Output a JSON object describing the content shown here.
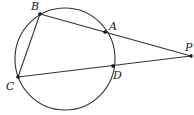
{
  "diagram": {
    "type": "geometry",
    "circle": {
      "cx": 65,
      "cy": 59,
      "rx": 50,
      "ry": 51
    },
    "points": [
      {
        "id": "B",
        "label": "B",
        "x": 40,
        "y": 14,
        "lx": 31,
        "ly": 10
      },
      {
        "id": "A",
        "label": "A",
        "x": 105,
        "y": 32,
        "lx": 109,
        "ly": 30
      },
      {
        "id": "P",
        "label": "P",
        "x": 191,
        "y": 56,
        "lx": 185,
        "ly": 51
      },
      {
        "id": "C",
        "label": "C",
        "x": 18,
        "y": 77,
        "lx": 6,
        "ly": 90
      },
      {
        "id": "D",
        "label": "D",
        "x": 113,
        "y": 66,
        "lx": 113,
        "ly": 79
      }
    ],
    "segments": [
      [
        "B",
        "P"
      ],
      [
        "C",
        "P"
      ],
      [
        "B",
        "C"
      ]
    ]
  }
}
